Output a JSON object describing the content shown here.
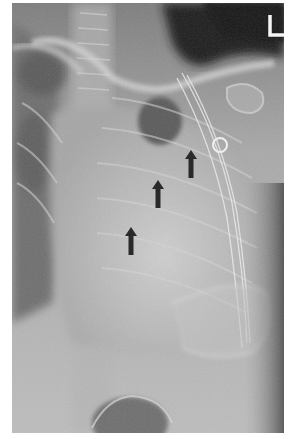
{
  "image": {
    "type": "chest-radiograph",
    "view": "frontal",
    "side_marker": "L",
    "annotations": {
      "arrows": [
        {
          "id": "arrow-upper",
          "x": 185,
          "y": 165,
          "direction": "up",
          "color": "#2a2a2a"
        },
        {
          "id": "arrow-middle",
          "x": 158,
          "y": 193,
          "direction": "up",
          "color": "#2a2a2a"
        },
        {
          "id": "arrow-lower",
          "x": 132,
          "y": 240,
          "direction": "up",
          "color": "#2a2a2a"
        }
      ],
      "ring_marker": {
        "x": 220,
        "y": 145,
        "r": 7,
        "color": "#e8e8e8"
      }
    },
    "colors": {
      "background": "#ffffff",
      "dark_air": "#1c1c1c",
      "soft_tissue": "#a8a8a8",
      "bone": "#d8d8d8",
      "arrow": "#2a2a2a"
    }
  }
}
